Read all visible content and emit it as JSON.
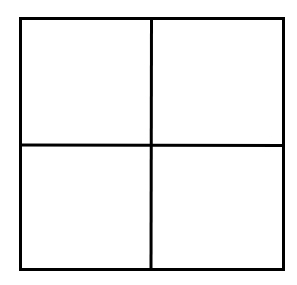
{
  "diagram": {
    "type": "grid",
    "rows": 2,
    "columns": 2,
    "stroke_color": "#000000",
    "background_color": "#ffffff",
    "stroke_width": 3,
    "outer_box": {
      "x": 19,
      "y": 17,
      "width": 265,
      "height": 253
    },
    "divider_x": 151,
    "divider_y": 145,
    "cells": [
      {
        "row": 1,
        "col": 1,
        "label": ""
      },
      {
        "row": 1,
        "col": 2,
        "label": ""
      },
      {
        "row": 2,
        "col": 1,
        "label": ""
      },
      {
        "row": 2,
        "col": 2,
        "label": ""
      }
    ]
  }
}
